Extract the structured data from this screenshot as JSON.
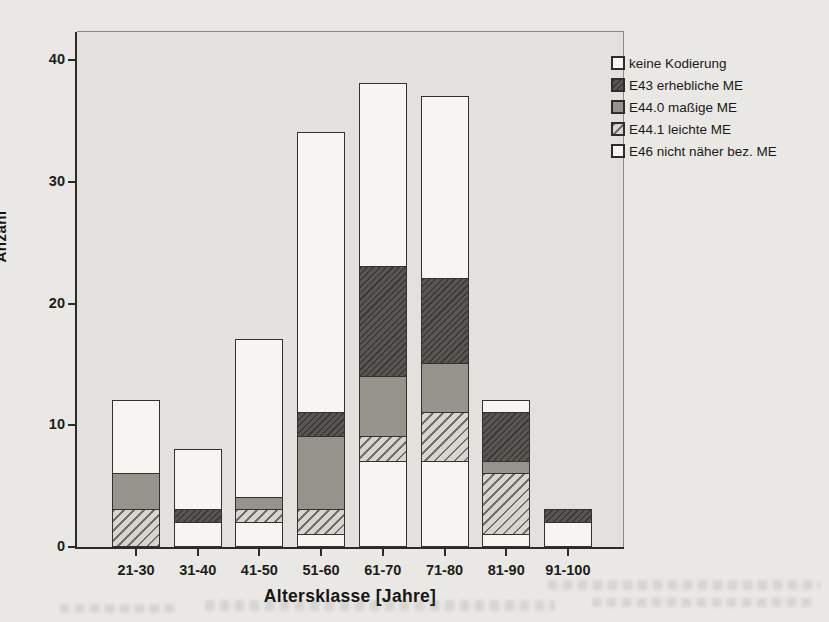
{
  "figure_type": "scanned-statistics-figure",
  "chart_data": {
    "type": "bar",
    "stacked": true,
    "title": "",
    "xlabel": "Altersklasse [Jahre]",
    "ylabel": "Anzahl",
    "ylim": [
      0,
      42
    ],
    "yticks": [
      0,
      10,
      20,
      30,
      40
    ],
    "grid": false,
    "legend_position": "top-right",
    "categories": [
      "21-30",
      "31-40",
      "41-50",
      "51-60",
      "61-70",
      "71-80",
      "81-90",
      "91-100"
    ],
    "series": [
      {
        "name": "E46 nicht näher bez. ME",
        "pattern": "white",
        "values": [
          0,
          2,
          2,
          1,
          7,
          7,
          1,
          2
        ]
      },
      {
        "name": "E44.1 leichte ME",
        "pattern": "light-hatch",
        "values": [
          3,
          0,
          1,
          2,
          2,
          4,
          5,
          0
        ]
      },
      {
        "name": "E44.0 maßige ME",
        "pattern": "gray",
        "values": [
          3,
          0,
          1,
          6,
          5,
          4,
          1,
          0
        ]
      },
      {
        "name": "E43 erhebliche ME",
        "pattern": "dark-hatch",
        "values": [
          0,
          1,
          0,
          2,
          9,
          7,
          4,
          1
        ]
      },
      {
        "name": "keine Kodierung",
        "pattern": "white",
        "values": [
          6,
          5,
          13,
          23,
          15,
          15,
          1,
          0
        ]
      }
    ],
    "totals": [
      12,
      8,
      17,
      34,
      38,
      37,
      12,
      3
    ],
    "legend": [
      {
        "label": "keine Kodierung",
        "pattern": "white"
      },
      {
        "label": "E43 erhebliche ME",
        "pattern": "dark-hatch"
      },
      {
        "label": "E44.0 maßige ME",
        "pattern": "gray"
      },
      {
        "label": "E44.1 leichte ME",
        "pattern": "light-hatch"
      },
      {
        "label": "E46 nicht näher bez. ME",
        "pattern": "white"
      }
    ],
    "colors": {
      "page_bg": "#e9e8e4",
      "plot_bg": "#e2e1dd",
      "segment_white": "#f6f5f1",
      "segment_gray": "#96938d",
      "hatch_dark_base": "#575652",
      "hatch_dark_line": "#3c3b37",
      "hatch_light_base": "#d7d5cf",
      "hatch_light_line": "#716f6a",
      "axis": "#2b2b28",
      "text": "#1a1a17"
    }
  }
}
